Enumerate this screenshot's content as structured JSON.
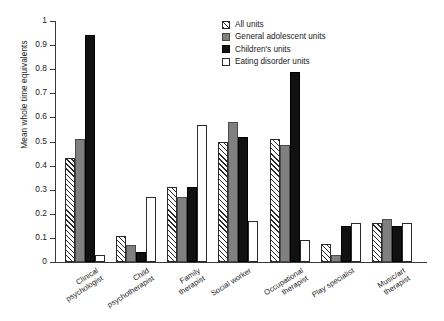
{
  "chart_data": {
    "type": "bar",
    "title": "",
    "xlabel": "",
    "ylabel": "Mean whole time equivalents",
    "ylim": [
      0,
      1
    ],
    "ytick_labels": [
      "0",
      "0.1",
      "0.2",
      "0.3",
      "0.4",
      "0.5",
      "0.6",
      "0.7",
      "0.8",
      "0.9",
      "1"
    ],
    "grid": false,
    "legend_position": "top-right",
    "categories": [
      "Clinical psychologist",
      "Child psychotherapist",
      "Family therapist",
      "Social worker",
      "Occupational therapist",
      "Play specialist",
      "Music/art therapist"
    ],
    "category_lines": [
      [
        "Clinical",
        "psychologist"
      ],
      [
        "Child",
        "psychotherapist"
      ],
      [
        "Family",
        "therapist"
      ],
      [
        "Social worker"
      ],
      [
        "Occupational",
        "therapist"
      ],
      [
        "Play specialist"
      ],
      [
        "Music/art",
        "therapist"
      ]
    ],
    "series": [
      {
        "name": "All units",
        "style": "hatch",
        "color": "#ffffff",
        "values": [
          0.43,
          0.11,
          0.31,
          0.5,
          0.51,
          0.075,
          0.16
        ]
      },
      {
        "name": "General adolescent units",
        "style": "gray",
        "color": "#808080",
        "values": [
          0.51,
          0.07,
          0.27,
          0.58,
          0.485,
          0.03,
          0.18
        ]
      },
      {
        "name": "Children's units",
        "style": "black",
        "color": "#111111",
        "values": [
          0.94,
          0.04,
          0.31,
          0.52,
          0.79,
          0.15,
          0.15
        ]
      },
      {
        "name": "Eating disorder units",
        "style": "white",
        "color": "#ffffff",
        "values": [
          0.03,
          0.27,
          0.57,
          0.17,
          0.09,
          0.16,
          0.16
        ]
      }
    ]
  }
}
